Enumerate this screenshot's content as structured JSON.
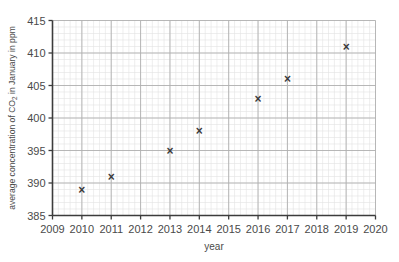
{
  "chart_data": {
    "type": "scatter",
    "title": "",
    "xlabel": "year",
    "ylabel": "average concentration of CO₂ in January in ppm",
    "xlim": [
      2009,
      2020
    ],
    "ylim": [
      385,
      415
    ],
    "xticks": [
      "2009",
      "2010",
      "2011",
      "2012",
      "2013",
      "2014",
      "2015",
      "2016",
      "2017",
      "2018",
      "2019",
      "2020"
    ],
    "yticks": [
      "385",
      "390",
      "395",
      "400",
      "405",
      "410",
      "415"
    ],
    "grid": "major and minor graph-paper grid",
    "legend": "none",
    "marker": "×",
    "x": [
      2010,
      2011,
      2013,
      2014,
      2016,
      2017,
      2019
    ],
    "values": [
      389,
      391,
      395,
      398,
      403,
      406,
      411
    ],
    "points": [
      {
        "year": 2010,
        "ppm": 389
      },
      {
        "year": 2011,
        "ppm": 391
      },
      {
        "year": 2013,
        "ppm": 395
      },
      {
        "year": 2014,
        "ppm": 398
      },
      {
        "year": 2016,
        "ppm": 403
      },
      {
        "year": 2017,
        "ppm": 406
      },
      {
        "year": 2019,
        "ppm": 411
      }
    ],
    "colors": {
      "background": "#ffffff",
      "minor_grid": "#e3e3e3",
      "major_grid": "#b0b0b0",
      "axis": "#3c3c3c",
      "marker": "#3a3a3a",
      "text": "#4a4a4a"
    }
  }
}
